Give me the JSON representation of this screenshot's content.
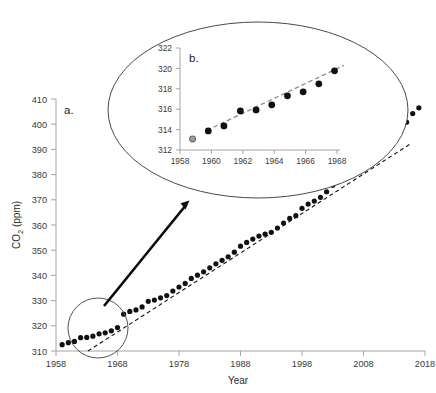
{
  "figure": {
    "background_color": "#ffffff",
    "dot_color": "#111111",
    "trend_color_main": "#111111",
    "trend_color_inset": "#8c8c8c",
    "axis_color": "#9a9a9a",
    "callout_color": "#4a4a4a",
    "highlight_marker_fill": "#9d9d9d",
    "highlight_marker_stroke": "#6a6a6a"
  },
  "chart_data": [
    {
      "id": "panel-a",
      "type": "scatter",
      "title": "",
      "panel_label": "a.",
      "xlabel": "Year",
      "ylabel": "CO2 (ppm)",
      "ylabel_parts": {
        "base": "CO",
        "subscript": "2",
        "units": " (ppm)"
      },
      "xlim": [
        1958,
        2018
      ],
      "ylim": [
        310,
        410
      ],
      "xticks": [
        1958,
        1968,
        1978,
        1988,
        1998,
        2008,
        2018
      ],
      "yticks": [
        310,
        320,
        330,
        340,
        350,
        360,
        370,
        380,
        390,
        400,
        410
      ],
      "xtick_labels": [
        "1958",
        "1968",
        "1978",
        "1988",
        "1998",
        "2008",
        "2018"
      ],
      "ytick_labels": [
        "310",
        "320",
        "330",
        "340",
        "350",
        "360",
        "370",
        "380",
        "390",
        "400",
        "410"
      ],
      "grid": false,
      "legend": "none",
      "series": [
        {
          "name": "Annual mean atmospheric CO2",
          "marker": "filled-circle",
          "x": [
            1959,
            1960,
            1961,
            1962,
            1963,
            1964,
            1965,
            1966,
            1967,
            1968,
            1969,
            1970,
            1971,
            1972,
            1973,
            1974,
            1975,
            1976,
            1977,
            1978,
            1979,
            1980,
            1981,
            1982,
            1983,
            1984,
            1985,
            1986,
            1987,
            1988,
            1989,
            1990,
            1991,
            1992,
            1993,
            1994,
            1995,
            1996,
            1997,
            1998,
            1999,
            2000,
            2001,
            2002,
            2003,
            2004,
            2005,
            2006,
            2007,
            2008,
            2009,
            2010,
            2011,
            2012,
            2013,
            2014,
            2015,
            2016,
            2017
          ],
          "values": [
            312.5,
            313.3,
            313.8,
            315.3,
            315.4,
            315.9,
            316.8,
            317.2,
            318.0,
            319.3,
            324.6,
            325.7,
            326.3,
            327.5,
            329.7,
            330.2,
            331.1,
            332.0,
            333.8,
            335.4,
            336.8,
            338.8,
            340.1,
            341.4,
            343.0,
            344.6,
            346.0,
            347.4,
            349.2,
            351.6,
            353.1,
            354.4,
            355.6,
            356.4,
            357.1,
            358.8,
            360.8,
            362.6,
            363.7,
            366.6,
            368.3,
            369.5,
            371.0,
            373.2,
            375.8,
            377.5,
            379.8,
            381.9,
            383.8,
            385.6,
            387.4,
            389.9,
            391.6,
            393.8,
            396.5,
            398.6,
            400.8,
            404.2,
            406.5
          ]
        }
      ],
      "trend_line": {
        "name": "linear-trend",
        "style": "dashed",
        "x_start": 1963.2,
        "y_start": 310.0,
        "x_end": 2015.5,
        "y_end": 392.0
      },
      "annotations": [
        {
          "type": "circle-callout",
          "label": "zoom-region",
          "x_center": 1963.5,
          "y_center": 317.0
        },
        {
          "type": "arrow",
          "label": "zoom-arrow",
          "from_x": 1964.5,
          "from_y": 322.0,
          "to_x": 1978.5,
          "to_y": 372.0
        }
      ]
    },
    {
      "id": "panel-b",
      "type": "scatter",
      "title": "",
      "panel_label": "b.",
      "xlabel": "",
      "ylabel": "",
      "xlim": [
        1958,
        1968.6
      ],
      "ylim": [
        311.4,
        322
      ],
      "xticks": [
        1958,
        1960,
        1962,
        1964,
        1966,
        1968
      ],
      "yticks": [
        312,
        314,
        316,
        318,
        320,
        322
      ],
      "xtick_labels": [
        "1958",
        "1960",
        "1962",
        "1964",
        "1966",
        "1968"
      ],
      "ytick_labels": [
        "312",
        "314",
        "316",
        "318",
        "320",
        "322"
      ],
      "grid": false,
      "legend": "none",
      "series": [
        {
          "name": "Annual mean atmospheric CO2 (1959-1968)",
          "marker": "filled-circle",
          "x": [
            1959.8,
            1960.8,
            1961.85,
            1962.85,
            1963.85,
            1964.85,
            1965.85,
            1966.85,
            1967.85
          ],
          "values": [
            313.3,
            313.8,
            315.3,
            315.4,
            315.9,
            316.8,
            317.2,
            318.0,
            319.3
          ]
        },
        {
          "name": "First year (highlighted)",
          "marker": "gray-circle",
          "x": [
            1958.8
          ],
          "values": [
            312.5
          ]
        }
      ],
      "trend_line": {
        "name": "linear-trend",
        "style": "dashed",
        "x_start": 1959.7,
        "y_start": 313.35,
        "x_end": 1968.45,
        "y_end": 319.85
      }
    }
  ]
}
